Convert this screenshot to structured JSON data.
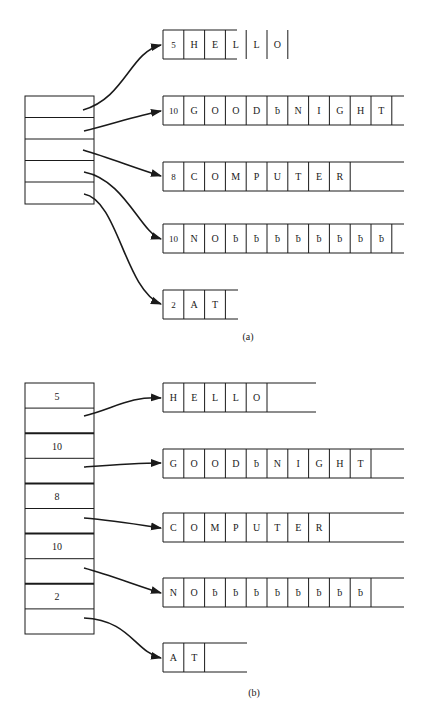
{
  "figure": {
    "parts": [
      {
        "id": "a",
        "caption": "(a)",
        "description": "Array of pointers to strings stored with a leading length byte",
        "pointer_array": {
          "rows": 5
        },
        "strings": [
          {
            "length": "5",
            "chars": [
              "H",
              "E",
              "L",
              "L",
              "O"
            ]
          },
          {
            "length": "10",
            "chars": [
              "G",
              "O",
              "O",
              "D",
              "ƀ",
              "N",
              "I",
              "G",
              "H",
              "T"
            ]
          },
          {
            "length": "8",
            "chars": [
              "C",
              "O",
              "M",
              "P",
              "U",
              "T",
              "E",
              "R"
            ]
          },
          {
            "length": "10",
            "chars": [
              "N",
              "O",
              "ƀ",
              "ƀ",
              "ƀ",
              "ƀ",
              "ƀ",
              "ƀ",
              "ƀ",
              "ƀ"
            ]
          },
          {
            "length": "2",
            "chars": [
              "A",
              "T"
            ]
          }
        ]
      },
      {
        "id": "b",
        "caption": "(b)",
        "description": "Array of (length, pointer) descriptors pointing to raw character strings",
        "descriptors": [
          {
            "length": "5"
          },
          {
            "length": "10"
          },
          {
            "length": "8"
          },
          {
            "length": "10"
          },
          {
            "length": "2"
          }
        ],
        "strings": [
          {
            "chars": [
              "H",
              "E",
              "L",
              "L",
              "O"
            ]
          },
          {
            "chars": [
              "G",
              "O",
              "O",
              "D",
              "ƀ",
              "N",
              "I",
              "G",
              "H",
              "T"
            ]
          },
          {
            "chars": [
              "C",
              "O",
              "M",
              "P",
              "U",
              "T",
              "E",
              "R"
            ]
          },
          {
            "chars": [
              "N",
              "O",
              "ƀ",
              "ƀ",
              "ƀ",
              "ƀ",
              "ƀ",
              "ƀ",
              "ƀ",
              "ƀ"
            ]
          },
          {
            "chars": [
              "A",
              "T"
            ]
          }
        ]
      }
    ],
    "blank_symbol": "ƀ",
    "colors": {
      "line": "#1a1a1a",
      "background": "#ffffff"
    }
  }
}
